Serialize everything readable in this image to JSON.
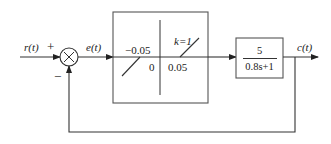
{
  "diagram": {
    "type": "closed-loop control block diagram",
    "signals": {
      "input": "r(t)",
      "error": "e(t)",
      "output": "c(t)"
    },
    "summing_junction": {
      "symbol": "×",
      "plus_sign": "+",
      "minus_sign": "−"
    },
    "nonlinear_block": {
      "description": "dead-zone nonlinearity",
      "left_threshold": "−0.05",
      "origin": "0",
      "right_threshold": "0.05",
      "slope_label": "k=1"
    },
    "linear_block": {
      "numerator": "5",
      "denominator": "0.8s+1"
    },
    "feedback": "unity negative feedback",
    "colors": {
      "line": "#333333",
      "box_border": "#555555",
      "background": "#ffffff"
    }
  }
}
